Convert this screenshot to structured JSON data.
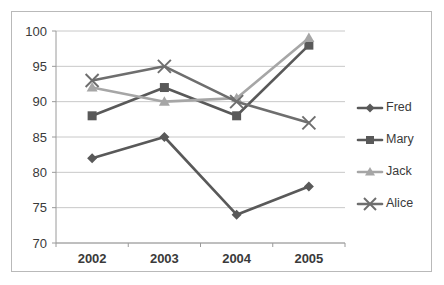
{
  "chart_data": {
    "type": "line",
    "title": "",
    "subtitle": "",
    "xlabel": "",
    "ylabel": "",
    "categories": [
      "2002",
      "2003",
      "2004",
      "2005"
    ],
    "ylim": [
      70,
      100
    ],
    "yticks": [
      70,
      75,
      80,
      85,
      90,
      95,
      100
    ],
    "grid": true,
    "legend_position": "right",
    "series": [
      {
        "name": "Fred",
        "marker": "diamond",
        "color": "#595959",
        "values": [
          82,
          85,
          74,
          78
        ]
      },
      {
        "name": "Mary",
        "marker": "square",
        "color": "#595959",
        "values": [
          88,
          92,
          88,
          98
        ]
      },
      {
        "name": "Jack",
        "marker": "triangle",
        "color": "#a6a6a6",
        "values": [
          92,
          90,
          90.5,
          99
        ]
      },
      {
        "name": "Alice",
        "marker": "x",
        "color": "#6e6e6e",
        "values": [
          93,
          95,
          90,
          87
        ]
      }
    ]
  },
  "axes": {
    "y_tick_labels": [
      "100",
      "95",
      "90",
      "85",
      "80",
      "75",
      "70"
    ],
    "x_tick_labels": [
      "2002",
      "2003",
      "2004",
      "2005"
    ]
  },
  "legend": {
    "entries": [
      {
        "label": "Fred"
      },
      {
        "label": "Mary"
      },
      {
        "label": "Jack"
      },
      {
        "label": "Alice"
      }
    ]
  },
  "colors": {
    "frame": "#b9b9b9",
    "gridline": "#c8c8c8",
    "axis": "#9a9a9a",
    "text": "#3a3a3a",
    "background": "#ffffff"
  }
}
